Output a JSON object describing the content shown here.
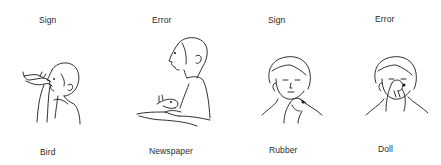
{
  "panels": [
    {
      "header": "Sign",
      "caption": "Bird",
      "pose": "profile-hand-at-mouth"
    },
    {
      "header": "Error",
      "caption": "Newspaper",
      "pose": "profile-hands-forward"
    },
    {
      "header": "Sign",
      "caption": "Rubber",
      "pose": "frontal-hand-at-chin"
    },
    {
      "header": "Error",
      "caption": "Doll",
      "pose": "frontal-hand-at-nose"
    }
  ],
  "colors": {
    "background": "#ffffff",
    "ink": "#1a1a1a"
  }
}
